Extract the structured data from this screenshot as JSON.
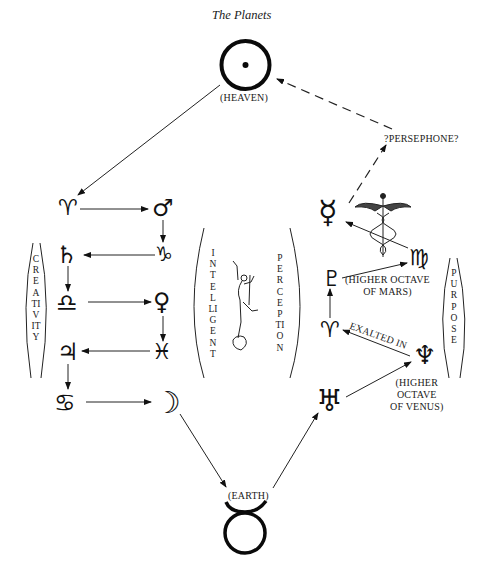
{
  "title": "The Planets",
  "heaven": {
    "label": "(HEAVEN)",
    "symbol": "☉"
  },
  "earth": {
    "label": "(EARTH)",
    "symbol": "♉"
  },
  "left_chain": [
    {
      "name": "aries",
      "symbol": "♈"
    },
    {
      "name": "mars",
      "symbol": "♂"
    },
    {
      "name": "north-node",
      "symbol": "♑"
    },
    {
      "name": "saturn",
      "symbol": "♄"
    },
    {
      "name": "libra",
      "symbol": "♎"
    },
    {
      "name": "venus",
      "symbol": "♀"
    },
    {
      "name": "pisces",
      "symbol": "♓"
    },
    {
      "name": "jupiter",
      "symbol": "♃"
    },
    {
      "name": "cancer",
      "symbol": "♋"
    },
    {
      "name": "moon",
      "symbol": "☽"
    }
  ],
  "right_chain": [
    {
      "name": "uranus",
      "symbol": "♅"
    },
    {
      "name": "neptune",
      "symbol": "♆"
    },
    {
      "name": "aries",
      "symbol": "♈"
    },
    {
      "name": "pluto",
      "symbol": "♇"
    },
    {
      "name": "virgo",
      "symbol": "♍"
    },
    {
      "name": "mercury",
      "symbol": "☿"
    }
  ],
  "labels": {
    "persephone": "?PERSEPHONE?",
    "higher_octave_mars_1": "(HIGHER OCTAVE",
    "higher_octave_mars_2": "OF MARS)",
    "exalted_in": "EXALTED IN",
    "higher_octave_venus_1": "(HIGHER",
    "higher_octave_venus_2": "OCTAVE",
    "higher_octave_venus_3": "OF VENUS)"
  },
  "brackets": {
    "creativity": "CREATIVITY",
    "intelligent": "INTELLIGENT",
    "perception": "PERCEPTION",
    "purpose": "PURPOSE"
  },
  "images": {
    "caduceus": "caduceus-illustration",
    "mercury_statue": "winged-mercury-statue"
  }
}
